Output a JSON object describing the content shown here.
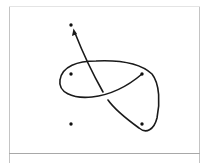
{
  "diagram": {
    "colors": {
      "background": "#ffffff",
      "frame": "#b8b8b8",
      "stroke": "#1a1a1a",
      "point": "#111111"
    },
    "points": [
      {
        "id": "top",
        "x": 71,
        "y": 25
      },
      {
        "id": "mid-left",
        "x": 71,
        "y": 74
      },
      {
        "id": "mid-right",
        "x": 142,
        "y": 74
      },
      {
        "id": "bottom-left",
        "x": 71,
        "y": 124
      },
      {
        "id": "bottom-right",
        "x": 142,
        "y": 124
      }
    ],
    "arrow": {
      "direction": "up",
      "tip_x": 73,
      "tip_y": 30
    }
  }
}
